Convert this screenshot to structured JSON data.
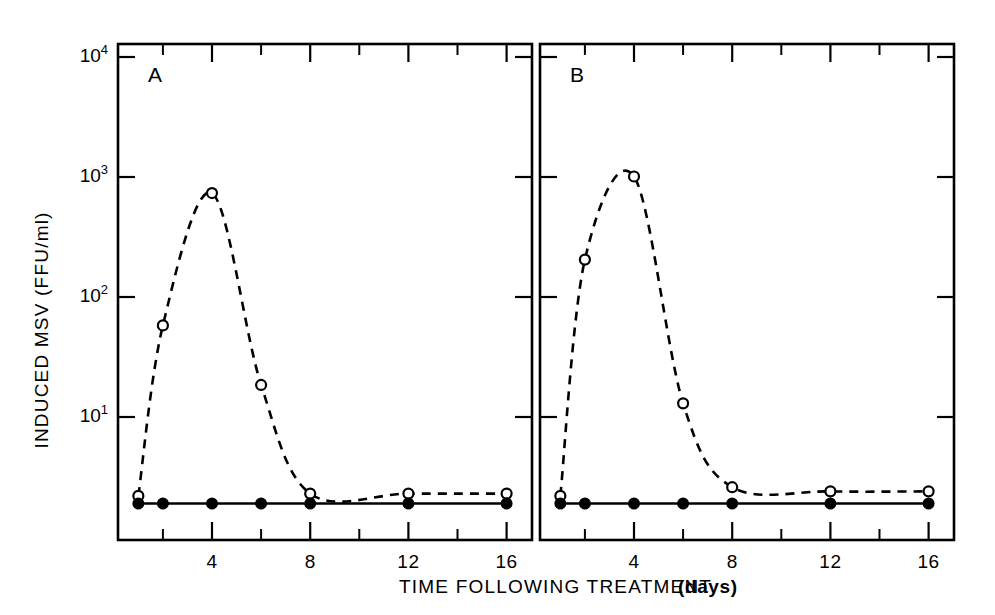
{
  "figure": {
    "panel_a_label": "A",
    "panel_b_label": "B",
    "x_axis_title_main": "TIME FOLLOWING TREATMENT",
    "x_axis_title_unit": "(days)",
    "y_axis_title": "INDUCED MSV (FFU/ml)",
    "ink_color": "#000000",
    "paper_color": "#ffffff"
  },
  "chart_data": {
    "type": "line",
    "title": "",
    "xlabel": "TIME FOLLOWING TREATMENT (days)",
    "ylabel": "INDUCED MSV (FFU/ml)",
    "yscale": "log",
    "ylim": [
      1.5,
      10000
    ],
    "xlim": [
      0,
      17.5
    ],
    "grid": false,
    "legend": "none",
    "y_ticks": [
      {
        "value": 10000,
        "label": "10",
        "exponent": "4"
      },
      {
        "value": 1000,
        "label": "10",
        "exponent": "3"
      },
      {
        "value": 100,
        "label": "10",
        "exponent": "2"
      },
      {
        "value": 10,
        "label": "10",
        "exponent": "1"
      }
    ],
    "x_ticks_major": [
      {
        "value": 4,
        "label": "4"
      },
      {
        "value": 8,
        "label": "8"
      },
      {
        "value": 12,
        "label": "12"
      },
      {
        "value": 16,
        "label": "16"
      }
    ],
    "x_ticks_minor": [
      2,
      6,
      10,
      14
    ],
    "panels": [
      {
        "id": "A",
        "label": "A",
        "series": [
          {
            "name": "induced-msv-treated",
            "marker": "open-circle",
            "linestyle": "dashed",
            "x": [
              1,
              2,
              4,
              6,
              8,
              12,
              16
            ],
            "y": [
              2.2,
              58,
              735,
              18.5,
              2.3,
              2.3,
              2.3
            ]
          },
          {
            "name": "control",
            "marker": "closed-circle",
            "linestyle": "solid",
            "x": [
              1,
              2,
              4,
              6,
              8,
              12,
              16
            ],
            "y": [
              1.9,
              1.9,
              1.9,
              1.9,
              1.9,
              1.9,
              1.9
            ]
          }
        ]
      },
      {
        "id": "B",
        "label": "B",
        "series": [
          {
            "name": "induced-msv-treated",
            "marker": "open-circle",
            "linestyle": "dashed",
            "x": [
              1,
              2,
              4,
              6,
              8,
              12,
              16
            ],
            "y": [
              2.2,
              205,
              1010,
              13,
              2.6,
              2.4,
              2.4
            ]
          },
          {
            "name": "control",
            "marker": "closed-circle",
            "linestyle": "solid",
            "x": [
              1,
              2,
              4,
              6,
              8,
              12,
              16
            ],
            "y": [
              1.9,
              1.9,
              1.9,
              1.9,
              1.9,
              1.9,
              1.9
            ]
          }
        ]
      }
    ]
  },
  "geometry": {
    "panel_a": {
      "left": 118,
      "right": 532,
      "top": 44,
      "bottom": 540
    },
    "panel_b": {
      "left": 540,
      "right": 954,
      "top": 44,
      "bottom": 540
    }
  }
}
